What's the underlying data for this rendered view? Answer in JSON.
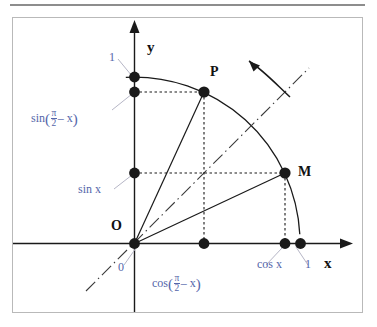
{
  "figure": {
    "kind": "unit-circle-complementary-angles",
    "axes": {
      "x_label": "x",
      "y_label": "y",
      "origin_label": "O",
      "origin_value_label": "0",
      "x_unit_label": "1",
      "y_unit_label": "1"
    },
    "points": [
      {
        "id": "P",
        "label": "P",
        "x": 204,
        "y": 92,
        "angle_deg": 65
      },
      {
        "id": "M",
        "label": "M",
        "x": 285,
        "y": 173,
        "angle_deg": 25
      }
    ],
    "annotations": {
      "sin_x": "sin x",
      "cos_x": "cos x",
      "sin_complement_prefix": "sin",
      "cos_complement_prefix": "cos",
      "complement_numerator": "π",
      "complement_denominator": "2",
      "complement_tail": "– x",
      "paren_open": "(",
      "paren_close": ")"
    },
    "colors": {
      "annotation_blue": "#5566aa",
      "stroke_black": "#1a1a1a",
      "frame_gray": "#b9b9b9",
      "rule_gray": "#8d8d8d",
      "leader_gray": "#b6b6c6"
    },
    "geometry": {
      "origin_px": [
        134,
        243
      ],
      "radius_px": 166,
      "arc_start_deg": -3,
      "arc_end_deg": 93,
      "bisector_deg": 45
    },
    "rotation_arrow": {
      "direction": "counterclockwise",
      "from_px": [
        290,
        96
      ],
      "to_px": [
        248,
        57
      ]
    }
  }
}
